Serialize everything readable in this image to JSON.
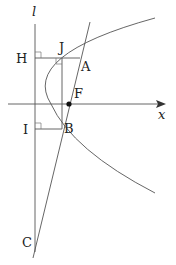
{
  "labels": {
    "directrix": "l",
    "H": "H",
    "J": "J",
    "A": "A",
    "F": "F",
    "I": "I",
    "B": "B",
    "C": "C",
    "x_axis": "x"
  },
  "colors": {
    "stroke": "#555555",
    "point": "#111111",
    "text": "#222222"
  }
}
